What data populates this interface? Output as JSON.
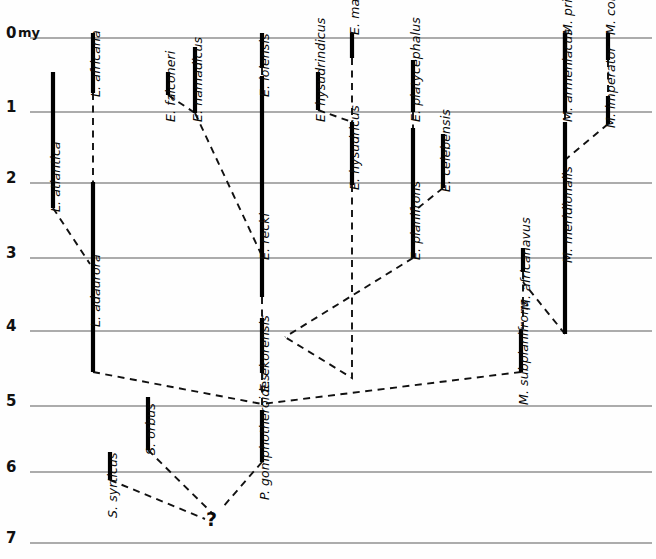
{
  "figure": {
    "type": "phylogeny-range-chart",
    "background": "#fefefe",
    "width": 656,
    "height": 559,
    "axis_unit_label": "my",
    "range_bar_color": "#000000",
    "gridline_color": "#5a5a5a",
    "lineage_line_color": "#111111",
    "uncertain_marker": "?"
  },
  "time_axis": {
    "name": "time-axis",
    "unit": "my",
    "ticks": [
      {
        "label": "0",
        "y": 38
      },
      {
        "label": "1",
        "y": 112
      },
      {
        "label": "2",
        "y": 183
      },
      {
        "label": "3",
        "y": 258
      },
      {
        "label": "4",
        "y": 331
      },
      {
        "label": "5",
        "y": 406
      },
      {
        "label": "6",
        "y": 472
      },
      {
        "label": "7",
        "y": 543
      }
    ]
  },
  "taxa": [
    {
      "name": "L. atlantica",
      "x": 53,
      "top": 72,
      "bottom": 208,
      "label_x": 48,
      "label_y": 212
    },
    {
      "name": "L. africana",
      "x": 93,
      "top": 33,
      "bottom": 93,
      "label_x": 88,
      "label_y": 97
    },
    {
      "name": "L. adaurora",
      "x": 93,
      "top": 182,
      "bottom": 372,
      "label_x": 88,
      "label_y": 327
    },
    {
      "name": "E. falconeri",
      "x": 168,
      "top": 72,
      "bottom": 95,
      "label_x": 163,
      "label_y": 122
    },
    {
      "name": "E. namadicus",
      "x": 195,
      "top": 47,
      "bottom": 113,
      "label_x": 190,
      "label_y": 122
    },
    {
      "name": "E. iolensis",
      "x": 262,
      "top": 33,
      "bottom": 68,
      "label_x": 257,
      "label_y": 97
    },
    {
      "name": "E. recki",
      "x": 262,
      "top": 76,
      "bottom": 297,
      "label_x": 257,
      "label_y": 260
    },
    {
      "name": "E. ekorensis",
      "x": 262,
      "top": 318,
      "bottom": 373,
      "label_x": 257,
      "label_y": 392
    },
    {
      "name": "E. hysudrindicus",
      "x": 318,
      "top": 72,
      "bottom": 110,
      "label_x": 313,
      "label_y": 122
    },
    {
      "name": "E. maximus",
      "x": 352,
      "top": 33,
      "bottom": 58,
      "label_x": 347,
      "label_y": 35
    },
    {
      "name": "E. hysudricus",
      "x": 352,
      "top": 122,
      "bottom": 185,
      "label_x": 347,
      "label_y": 190
    },
    {
      "name": "E. platycephalus",
      "x": 413,
      "top": 60,
      "bottom": 112,
      "label_x": 408,
      "label_y": 122
    },
    {
      "name": "E. planifrons",
      "x": 413,
      "top": 128,
      "bottom": 258,
      "label_x": 408,
      "label_y": 260
    },
    {
      "name": "E. celebensis",
      "x": 443,
      "top": 134,
      "bottom": 188,
      "label_x": 438,
      "label_y": 192
    },
    {
      "name": "M. armeniacus",
      "x": 565,
      "top": 33,
      "bottom": 112,
      "label_x": 560,
      "label_y": 122
    },
    {
      "name": "M. primigenius",
      "x": 565,
      "top": 33,
      "bottom": 58,
      "label_x": 560,
      "label_y": 35
    },
    {
      "name": "M. meridionalis",
      "x": 565,
      "top": 122,
      "bottom": 334,
      "label_x": 560,
      "label_y": 263
    },
    {
      "name": "M. imperator",
      "x": 608,
      "top": 96,
      "bottom": 124,
      "label_x": 603,
      "label_y": 128
    },
    {
      "name": "M. columbi",
      "x": 608,
      "top": 33,
      "bottom": 60,
      "label_x": 603,
      "label_y": 35
    },
    {
      "name": "M. africanavus",
      "x": 523,
      "top": 248,
      "bottom": 272,
      "label_x": 518,
      "label_y": 310
    },
    {
      "name": "M. subplanifrons",
      "x": 521,
      "top": 330,
      "bottom": 372,
      "label_x": 516,
      "label_y": 405
    },
    {
      "name": "S. orbus",
      "x": 148,
      "top": 397,
      "bottom": 450,
      "label_x": 143,
      "label_y": 455
    },
    {
      "name": "S. syrticus",
      "x": 110,
      "top": 452,
      "bottom": 480,
      "label_x": 105,
      "label_y": 518
    },
    {
      "name": "P. gomphotheroides",
      "x": 262,
      "top": 410,
      "bottom": 462,
      "label_x": 257,
      "label_y": 500
    }
  ],
  "lineage_links": [
    {
      "from": "L. africana",
      "to": "L. adaurora",
      "style": "dashed",
      "points": "93,93 93,182"
    },
    {
      "from": "L. atlantica",
      "to": "L. adaurora",
      "style": "dashed",
      "points": "53,208 90,264"
    },
    {
      "from": "E. falconeri",
      "to": "E. namadicus",
      "style": "dashed",
      "points": "168,95 195,113"
    },
    {
      "from": "E. namadicus",
      "to": "E. recki",
      "style": "dashed",
      "points": "195,113 262,256"
    },
    {
      "from": "E. iolensis",
      "to": "E. recki",
      "style": "dashed",
      "points": "262,68 262,76"
    },
    {
      "from": "E. recki",
      "to": "E. ekorensis",
      "style": "dashed",
      "points": "262,297 262,318"
    },
    {
      "from": "E. hysudrindicus",
      "to": "E. hysudricus",
      "style": "dashed",
      "points": "318,110 352,122"
    },
    {
      "from": "E. maximus",
      "to": "E. hysudricus",
      "style": "dashed",
      "points": "352,58 352,122"
    },
    {
      "from": "E. hysudricus",
      "to": "E. planifrons",
      "style": "dashed",
      "points": "352,185 352,378 285,337"
    },
    {
      "from": "E. platycephalus",
      "to": "E. planifrons",
      "style": "dashed",
      "points": "413,112 413,128"
    },
    {
      "from": "E. celebensis",
      "to": "E. planifrons",
      "style": "dashed",
      "points": "443,188 413,212"
    },
    {
      "from": "E. planifrons",
      "to": "E. ekorensis",
      "style": "dashed",
      "points": "413,258 285,337"
    },
    {
      "from": "M. primigenius",
      "to": "M. armeniacus",
      "style": "dashed",
      "points": "565,58 565,33"
    },
    {
      "from": "M. armeniacus",
      "to": "M. meridionalis",
      "style": "dashed",
      "points": "565,112 565,122"
    },
    {
      "from": "M. imperator",
      "to": "M. meridionalis",
      "style": "dashed",
      "points": "608,124 565,160"
    },
    {
      "from": "M. columbi",
      "to": "M. imperator",
      "style": "dashed",
      "points": "608,60 608,96"
    },
    {
      "from": "M. meridionalis",
      "to": "M. africanavus",
      "style": "dashed",
      "points": "565,334 523,282"
    },
    {
      "from": "M. africanavus",
      "to": "M. subplanifrons",
      "style": "dashed",
      "points": "523,272 523,330"
    },
    {
      "from": "M. subplanifrons",
      "to": "P. gomphotheroides",
      "style": "dashed",
      "points": "521,372 262,404"
    },
    {
      "from": "L. adaurora",
      "to": "P. gomphotheroides",
      "style": "dashed",
      "points": "93,372 262,404"
    },
    {
      "from": "E. ekorensis",
      "to": "P. gomphotheroides",
      "style": "dashed",
      "points": "262,373 262,410"
    },
    {
      "from": "S. orbus",
      "to": "unknown",
      "style": "dashed",
      "points": "148,450 213,514"
    },
    {
      "from": "S. syrticus",
      "to": "unknown",
      "style": "dashed",
      "points": "110,480 205,519"
    },
    {
      "from": "P. gomphotheroides",
      "to": "unknown",
      "style": "dashed",
      "points": "262,462 222,508"
    }
  ],
  "annotations": [
    {
      "name": "uncertainty-marker",
      "text": "?",
      "x": 206,
      "y": 508
    }
  ]
}
